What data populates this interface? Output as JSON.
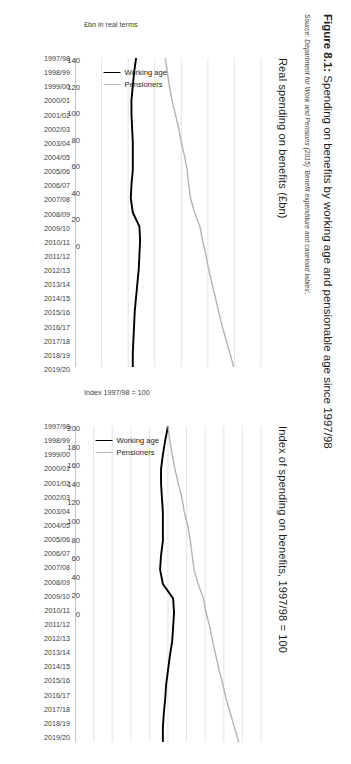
{
  "figure": {
    "number": "Figure 8.1:",
    "title": "Spending on benefits by working age and pensionable age since 1997/98",
    "full_title": "Figure 8.1: Spending on benefits by working age and pensionable age since 1997/98",
    "source": "Source: Department for Work and Pensions (2015) 'Benefit expenditure and caseload tables'."
  },
  "legend": {
    "working_age_label": "Working age",
    "pensioners_label": "Pensioners",
    "working_age_color": "#000000",
    "pensioners_color": "#b3b3b3"
  },
  "chart_data": [
    {
      "id": "real-spending",
      "type": "line",
      "title": "Real spending on benefits (£bn)",
      "xlabel": "",
      "ylabel": "£bn in real terms",
      "ylim": [
        0,
        140
      ],
      "yticks": [
        0,
        20,
        40,
        60,
        80,
        100,
        120,
        140
      ],
      "grid": true,
      "legend_position": "inside-right",
      "categories": [
        "1997/98",
        "1998/99",
        "1999/00",
        "2000/01",
        "2001/02",
        "2002/03",
        "2003/04",
        "2004/05",
        "2005/06",
        "2006/07",
        "2007/08",
        "2008/09",
        "2009/10",
        "2010/11",
        "2011/12",
        "2012/13",
        "2013/14",
        "2014/15",
        "2015/16",
        "2016/17",
        "2017/18",
        "2018/19",
        "2019/20"
      ],
      "series": [
        {
          "name": "Working age",
          "color": "#000000",
          "values": [
            46.0,
            44.5,
            43.5,
            42.5,
            42.5,
            43.0,
            43.5,
            43.5,
            43.5,
            42.5,
            42.0,
            43.5,
            48.5,
            49.0,
            48.5,
            48.0,
            47.0,
            46.0,
            45.0,
            44.5,
            44.0,
            43.5,
            43.5
          ]
        },
        {
          "name": "Pensioners",
          "color": "#b3b3b3",
          "values": [
            68.0,
            69.5,
            71.0,
            73.0,
            75.5,
            78.0,
            80.0,
            82.5,
            84.5,
            85.5,
            87.0,
            90.0,
            94.0,
            96.0,
            98.5,
            100.5,
            103.0,
            105.5,
            108.0,
            110.5,
            113.5,
            116.5,
            119.5
          ]
        }
      ]
    },
    {
      "id": "index-spending",
      "type": "line",
      "title": "Index of spending on benefits, 1997/98 = 100",
      "xlabel": "",
      "ylabel": "Index 1997/98 = 100",
      "ylim": [
        0,
        200
      ],
      "yticks": [
        0,
        20,
        40,
        60,
        80,
        100,
        120,
        140,
        160,
        180,
        200
      ],
      "grid": true,
      "legend_position": "inside-right",
      "categories": [
        "1997/98",
        "1998/99",
        "1999/00",
        "2000/01",
        "2001/02",
        "2002/03",
        "2003/04",
        "2004/05",
        "2005/06",
        "2006/07",
        "2007/08",
        "2008/09",
        "2009/10",
        "2010/11",
        "2011/12",
        "2012/13",
        "2013/14",
        "2014/15",
        "2015/16",
        "2016/17",
        "2017/18",
        "2018/19",
        "2019/20"
      ],
      "series": [
        {
          "name": "Working age",
          "color": "#000000",
          "values": [
            100,
            97,
            94.5,
            92.5,
            92.5,
            93.5,
            94.5,
            94.5,
            94.5,
            92.5,
            91.5,
            94.5,
            105.5,
            106.5,
            105.5,
            104.5,
            102,
            100,
            98,
            97,
            95.5,
            94.5,
            94.5
          ]
        },
        {
          "name": "Pensioners",
          "color": "#b3b3b3",
          "values": [
            100,
            102,
            104.5,
            107.5,
            111,
            115,
            117.5,
            121.5,
            124,
            126,
            128,
            132.5,
            138,
            141,
            145,
            148,
            151.5,
            155,
            159,
            162.5,
            167,
            171.5,
            176
          ]
        }
      ]
    }
  ]
}
